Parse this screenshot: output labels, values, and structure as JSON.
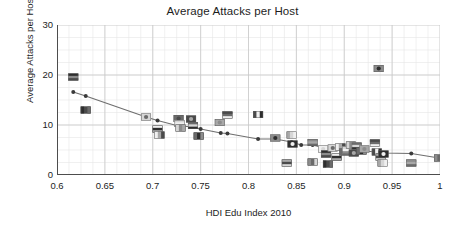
{
  "chart_data": {
    "type": "scatter",
    "title": "Average Attacks per Host",
    "xlabel": "HDI Edu Index 2010",
    "ylabel": "Average Attacks per Host",
    "xlim": [
      0.6,
      1.0
    ],
    "ylim": [
      0,
      30
    ],
    "xticks": [
      0.6,
      0.65,
      0.7,
      0.75,
      0.8,
      0.85,
      0.9,
      0.95,
      1
    ],
    "xtick_labels": [
      "0.6",
      "0.65",
      "0.7",
      "0.75",
      "0.8",
      "0.85",
      "0.9",
      "0.95",
      "1"
    ],
    "yticks": [
      0,
      10,
      20,
      30
    ],
    "ytick_labels": [
      "0",
      "10",
      "20",
      "30"
    ],
    "grid": "major and minor gridlines, light gray",
    "minor_x_step": 0.0125,
    "minor_y_step": 2.5,
    "legend": "none",
    "marker_style": "country flag thumbnails (grayscale)",
    "series": [
      {
        "name": "Countries (flag markers)",
        "marker": "flag-thumbnail",
        "points": [
          {
            "x": 0.617,
            "y": 19.6
          },
          {
            "x": 0.63,
            "y": 13.0
          },
          {
            "x": 0.693,
            "y": 11.6
          },
          {
            "x": 0.705,
            "y": 9.2
          },
          {
            "x": 0.707,
            "y": 8.0
          },
          {
            "x": 0.727,
            "y": 11.3
          },
          {
            "x": 0.728,
            "y": 10.3
          },
          {
            "x": 0.729,
            "y": 9.4
          },
          {
            "x": 0.74,
            "y": 11.2
          },
          {
            "x": 0.742,
            "y": 9.9
          },
          {
            "x": 0.748,
            "y": 7.8
          },
          {
            "x": 0.77,
            "y": 10.5
          },
          {
            "x": 0.778,
            "y": 12.0
          },
          {
            "x": 0.81,
            "y": 12.1
          },
          {
            "x": 0.828,
            "y": 7.4
          },
          {
            "x": 0.84,
            "y": 2.4
          },
          {
            "x": 0.845,
            "y": 8.0
          },
          {
            "x": 0.846,
            "y": 6.2
          },
          {
            "x": 0.867,
            "y": 6.5
          },
          {
            "x": 0.867,
            "y": 2.6
          },
          {
            "x": 0.878,
            "y": 5.2
          },
          {
            "x": 0.881,
            "y": 4.2
          },
          {
            "x": 0.883,
            "y": 2.2
          },
          {
            "x": 0.888,
            "y": 5.4
          },
          {
            "x": 0.892,
            "y": 3.6
          },
          {
            "x": 0.896,
            "y": 5.6
          },
          {
            "x": 0.9,
            "y": 4.6
          },
          {
            "x": 0.903,
            "y": 5.0
          },
          {
            "x": 0.907,
            "y": 6.0
          },
          {
            "x": 0.91,
            "y": 4.4
          },
          {
            "x": 0.913,
            "y": 5.8
          },
          {
            "x": 0.918,
            "y": 4.8
          },
          {
            "x": 0.921,
            "y": 5.2
          },
          {
            "x": 0.932,
            "y": 6.4
          },
          {
            "x": 0.934,
            "y": 4.6
          },
          {
            "x": 0.936,
            "y": 21.3
          },
          {
            "x": 0.938,
            "y": 3.6
          },
          {
            "x": 0.94,
            "y": 2.4
          },
          {
            "x": 0.941,
            "y": 4.2
          },
          {
            "x": 0.97,
            "y": 2.4
          },
          {
            "x": 0.999,
            "y": 3.4
          }
        ]
      },
      {
        "name": "Trend (binned mean)",
        "marker": "circle-connected",
        "points": [
          {
            "x": 0.617,
            "y": 16.6
          },
          {
            "x": 0.63,
            "y": 15.8
          },
          {
            "x": 0.693,
            "y": 11.6
          },
          {
            "x": 0.705,
            "y": 10.9
          },
          {
            "x": 0.729,
            "y": 9.7
          },
          {
            "x": 0.742,
            "y": 9.7
          },
          {
            "x": 0.75,
            "y": 9.2
          },
          {
            "x": 0.771,
            "y": 8.4
          },
          {
            "x": 0.778,
            "y": 8.3
          },
          {
            "x": 0.81,
            "y": 7.2
          },
          {
            "x": 0.828,
            "y": 7.2
          },
          {
            "x": 0.845,
            "y": 6.6
          },
          {
            "x": 0.855,
            "y": 6.0
          },
          {
            "x": 0.867,
            "y": 6.0
          },
          {
            "x": 0.881,
            "y": 5.3
          },
          {
            "x": 0.896,
            "y": 5.1
          },
          {
            "x": 0.91,
            "y": 5.0
          },
          {
            "x": 0.921,
            "y": 4.8
          },
          {
            "x": 0.934,
            "y": 4.6
          },
          {
            "x": 0.941,
            "y": 4.4
          },
          {
            "x": 0.97,
            "y": 4.3
          },
          {
            "x": 0.999,
            "y": 3.4
          }
        ]
      }
    ]
  },
  "colors": {
    "background": "#ffffff",
    "axis": "#4d4d4d",
    "grid_major": "#c9c9c9",
    "grid_minor": "#e6e6e6",
    "trend_line": "#6e6e6e",
    "marker_dark": "#3a3a3a",
    "text": "#1d1d1d"
  }
}
